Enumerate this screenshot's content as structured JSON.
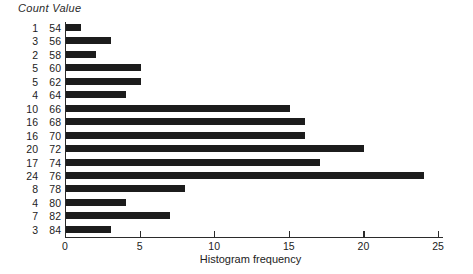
{
  "header": {
    "count_label": "Count",
    "value_label": "Value",
    "combined": "Count Value"
  },
  "axis": {
    "x_title": "Histogram frequency",
    "x_ticks": [
      "0",
      "5",
      "10",
      "15",
      "20",
      "25"
    ]
  },
  "colors": {
    "bar": "#1c1c1c",
    "axis": "#2b2b2b",
    "background": "#ffffff",
    "text": "#222222"
  },
  "chart_data": {
    "type": "bar",
    "orientation": "horizontal",
    "title": "",
    "xlabel": "Histogram frequency",
    "ylabel": "Value",
    "xlim": [
      0,
      25.5
    ],
    "xticks": [
      0,
      5,
      10,
      15,
      20,
      25
    ],
    "grid": false,
    "legend": null,
    "categories": [
      54,
      56,
      58,
      60,
      62,
      64,
      66,
      68,
      70,
      72,
      74,
      76,
      78,
      80,
      82,
      84
    ],
    "values": [
      1,
      3,
      2,
      5,
      5,
      4,
      15,
      16,
      16,
      20,
      17,
      24,
      8,
      4,
      7,
      3
    ],
    "rows": [
      {
        "count": "1",
        "value": "54",
        "n": 1
      },
      {
        "count": "3",
        "value": "56",
        "n": 3
      },
      {
        "count": "2",
        "value": "58",
        "n": 2
      },
      {
        "count": "5",
        "value": "60",
        "n": 5
      },
      {
        "count": "5",
        "value": "62",
        "n": 5
      },
      {
        "count": "4",
        "value": "64",
        "n": 4
      },
      {
        "count": "10",
        "value": "66",
        "n": 15
      },
      {
        "count": "16",
        "value": "68",
        "n": 16
      },
      {
        "count": "16",
        "value": "70",
        "n": 16
      },
      {
        "count": "20",
        "value": "72",
        "n": 20
      },
      {
        "count": "17",
        "value": "74",
        "n": 17
      },
      {
        "count": "24",
        "value": "76",
        "n": 24
      },
      {
        "count": "8",
        "value": "78",
        "n": 8
      },
      {
        "count": "4",
        "value": "80",
        "n": 4
      },
      {
        "count": "7",
        "value": "82",
        "n": 7
      },
      {
        "count": "3",
        "value": "84",
        "n": 3
      }
    ]
  }
}
